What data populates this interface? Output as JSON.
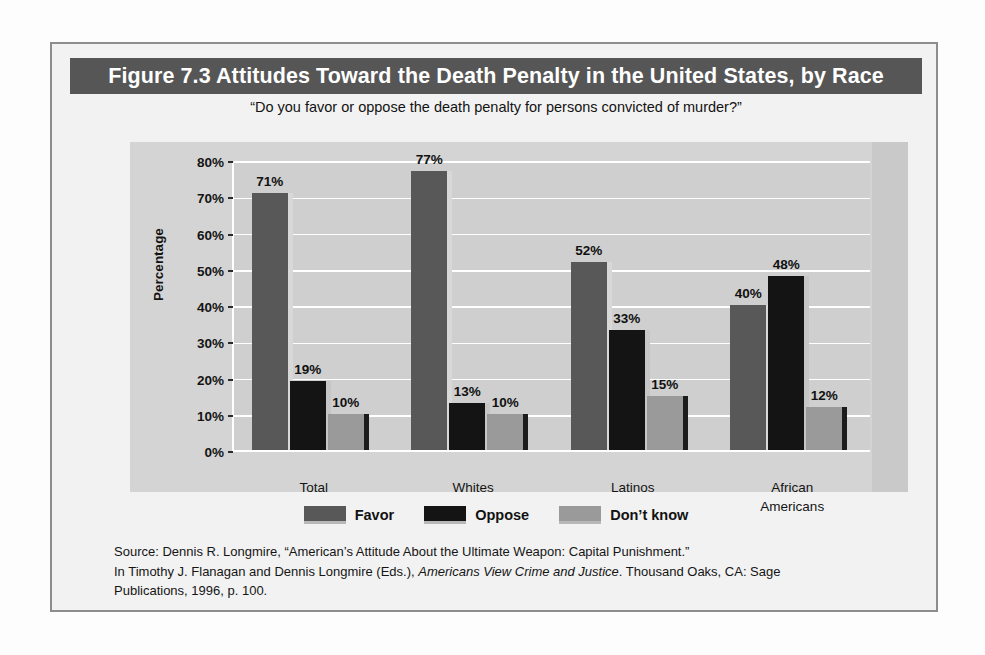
{
  "figure": {
    "title": "Figure 7.3  Attitudes Toward the Death Penalty in the United States, by Race",
    "subtitle": "“Do you favor or oppose the death penalty for persons convicted of murder?”",
    "source_line1": "Source: Dennis R. Longmire, “American’s Attitude About the Ultimate Weapon: Capital Punishment.”",
    "source_line2_a": "In Timothy J. Flanagan and Dennis Longmire (Eds.), ",
    "source_line2_italic": "Americans View Crime and Justice",
    "source_line2_b": ". Thousand Oaks, CA: Sage",
    "source_line3": "Publications, 1996, p. 100."
  },
  "colors": {
    "title_bar": "#565656",
    "favor": "#585858",
    "oppose": "#141414",
    "dont_know": "#9a9a9a",
    "panel": "#d4d4d4",
    "plot": "#cfcfcf",
    "gridline": "#ffffff"
  },
  "chart_data": {
    "type": "bar",
    "title": "Figure 7.3  Attitudes Toward the Death Penalty in the United States, by Race",
    "subtitle": "“Do you favor or oppose the death penalty for persons convicted of murder?”",
    "xlabel": "",
    "ylabel": "Percentage",
    "ylim": [
      0,
      80
    ],
    "yticks": [
      0,
      10,
      20,
      30,
      40,
      50,
      60,
      70,
      80
    ],
    "ytick_labels": [
      "0%",
      "10%",
      "20%",
      "30%",
      "40%",
      "50%",
      "60%",
      "70%",
      "80%"
    ],
    "grid": true,
    "legend_position": "bottom",
    "categories": [
      "Total",
      "Whites",
      "Latinos",
      "African Americans"
    ],
    "category_label_lines": [
      [
        "Total"
      ],
      [
        "Whites"
      ],
      [
        "Latinos"
      ],
      [
        "African",
        "Americans"
      ]
    ],
    "series": [
      {
        "name": "Favor",
        "color": "#585858",
        "values": [
          71,
          77,
          52,
          40
        ],
        "value_labels": [
          "71%",
          "77%",
          "52%",
          "40%"
        ]
      },
      {
        "name": "Oppose",
        "color": "#141414",
        "values": [
          19,
          13,
          33,
          48
        ],
        "value_labels": [
          "19%",
          "13%",
          "33%",
          "48%"
        ]
      },
      {
        "name": "Don’t know",
        "color": "#9a9a9a",
        "values": [
          10,
          10,
          15,
          12
        ],
        "value_labels": [
          "10%",
          "10%",
          "15%",
          "12%"
        ]
      }
    ]
  }
}
